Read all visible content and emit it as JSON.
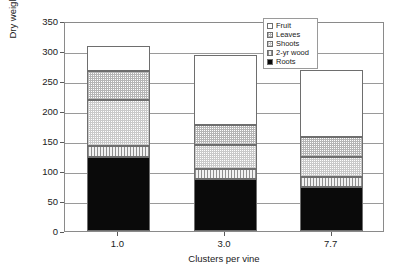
{
  "chart_data": {
    "type": "bar",
    "subtype": "stacked-bar",
    "title": "",
    "xlabel": "Clusters per vine",
    "ylabel": "Dry weight (g)",
    "categories": [
      "1.0",
      "3.0",
      "7.7"
    ],
    "ylim": [
      0,
      350
    ],
    "yticks": [
      0,
      50,
      100,
      150,
      200,
      250,
      300,
      350
    ],
    "ytick_labels": [
      "0",
      "50",
      "100",
      "150",
      "200",
      "250",
      "300",
      "350"
    ],
    "grid": true,
    "grid_axis": "y",
    "legend_position": "top-right",
    "stack_order_bottom_to_top": [
      "Roots",
      "2-yr wood",
      "Shoots",
      "Leaves",
      "Fruit"
    ],
    "series": [
      {
        "name": "Roots",
        "values": [
          123,
          87,
          73
        ],
        "fill": "solid-black",
        "color": "#0a0a0a"
      },
      {
        "name": "2-yr wood",
        "values": [
          19,
          17,
          17
        ],
        "fill": "vertical-stripe",
        "color": "#d8d8d8"
      },
      {
        "name": "Shoots",
        "values": [
          77,
          39,
          33
        ],
        "fill": "fine-dot-light",
        "color": "#e8e8e8"
      },
      {
        "name": "Leaves",
        "values": [
          48,
          34,
          34
        ],
        "fill": "fine-dot-gray",
        "color": "#dcdcdc"
      },
      {
        "name": "Fruit",
        "values": [
          41,
          116,
          111
        ],
        "fill": "none-white",
        "color": "#ffffff"
      }
    ],
    "stack_totals": [
      308,
      293,
      268
    ],
    "cumulative_tops": {
      "1.0": {
        "Roots": 123,
        "2-yr wood": 142,
        "Shoots": 219,
        "Leaves": 267,
        "Fruit": 308
      },
      "3.0": {
        "Roots": 87,
        "2-yr wood": 104,
        "Shoots": 143,
        "Leaves": 177,
        "Fruit": 293
      },
      "7.7": {
        "Roots": 73,
        "2-yr wood": 90,
        "Shoots": 123,
        "Leaves": 157,
        "Fruit": 268
      }
    }
  },
  "legend": {
    "items": [
      {
        "label": "Fruit",
        "swatch": "white-square-icon"
      },
      {
        "label": "Leaves",
        "swatch": "dotted-square-icon"
      },
      {
        "label": "Shoots",
        "swatch": "light-dotted-square-icon"
      },
      {
        "label": "2-yr wood",
        "swatch": "striped-square-icon"
      },
      {
        "label": "Roots",
        "swatch": "black-square-icon"
      }
    ]
  }
}
